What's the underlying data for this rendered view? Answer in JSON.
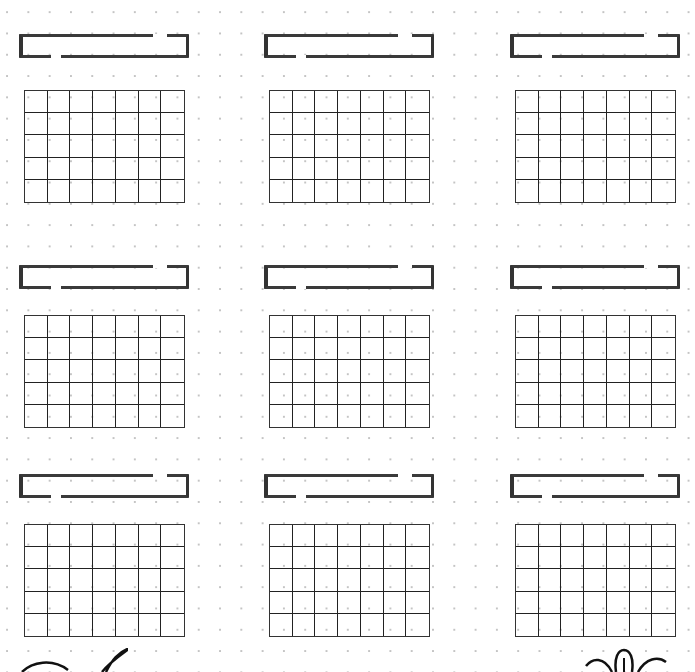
{
  "page": {
    "type": "dot-grid planner template",
    "dot_color": "#c4c4c4",
    "line_color": "#222222"
  },
  "layout": {
    "rows": 3,
    "columns": 3,
    "grid_cols": 7,
    "grid_rows": 5
  },
  "blocks": [
    {
      "id": "block-1",
      "header_label": "",
      "hx": 19,
      "hy": 34,
      "gx": 24,
      "gy": 90
    },
    {
      "id": "block-2",
      "header_label": "",
      "hx": 264,
      "hy": 34,
      "gx": 269,
      "gy": 90
    },
    {
      "id": "block-3",
      "header_label": "",
      "hx": 510,
      "hy": 34,
      "gx": 515,
      "gy": 90
    },
    {
      "id": "block-4",
      "header_label": "",
      "hx": 19,
      "hy": 265,
      "gx": 24,
      "gy": 315
    },
    {
      "id": "block-5",
      "header_label": "",
      "hx": 264,
      "hy": 265,
      "gx": 269,
      "gy": 315
    },
    {
      "id": "block-6",
      "header_label": "",
      "hx": 510,
      "hy": 265,
      "gx": 515,
      "gy": 315
    },
    {
      "id": "block-7",
      "header_label": "",
      "hx": 19,
      "hy": 474,
      "gx": 24,
      "gy": 524
    },
    {
      "id": "block-8",
      "header_label": "",
      "hx": 264,
      "hy": 474,
      "gx": 269,
      "gy": 524
    },
    {
      "id": "block-9",
      "header_label": "",
      "hx": 510,
      "hy": 474,
      "gx": 515,
      "gy": 524
    }
  ],
  "doodles": [
    {
      "name": "swirl-doodle-icon",
      "position": "bottom-left"
    },
    {
      "name": "flower-doodle-icon",
      "position": "bottom-right"
    }
  ]
}
